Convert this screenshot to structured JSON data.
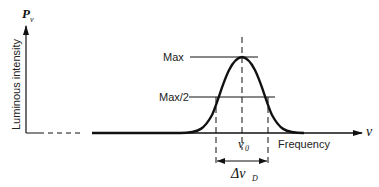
{
  "diagram": {
    "y_axis_symbol": "P",
    "y_axis_symbol_sub": "ν",
    "y_axis_label": "Luminous intensity",
    "x_axis_symbol": "ν",
    "x_axis_label": "Frequency",
    "max_label": "Max",
    "half_max_label": "Max/2",
    "center_symbol": "ν",
    "center_sub": "0",
    "width_symbol": "Δν",
    "width_sub": "D",
    "curve": "gaussian line profile"
  }
}
